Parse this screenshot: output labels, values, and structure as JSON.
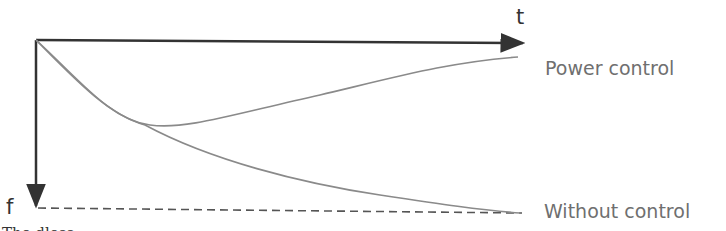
{
  "diagram": {
    "axes": {
      "x_label": "t",
      "y_label": "f"
    },
    "curves": [
      {
        "name": "Power control",
        "label": "Power control",
        "shape": "decreases from origin to a minimum then rises toward upper right"
      },
      {
        "name": "Without control",
        "label": "Without control",
        "shape": "monotonically decreases toward dashed asymptote"
      }
    ],
    "asymptote": {
      "style": "dashed",
      "position": "bottom, at f"
    },
    "caption_partial": "The dloss..."
  },
  "colors": {
    "axis": "#333333",
    "curve": "#8a8a8a",
    "label": "#6f6f6f"
  }
}
